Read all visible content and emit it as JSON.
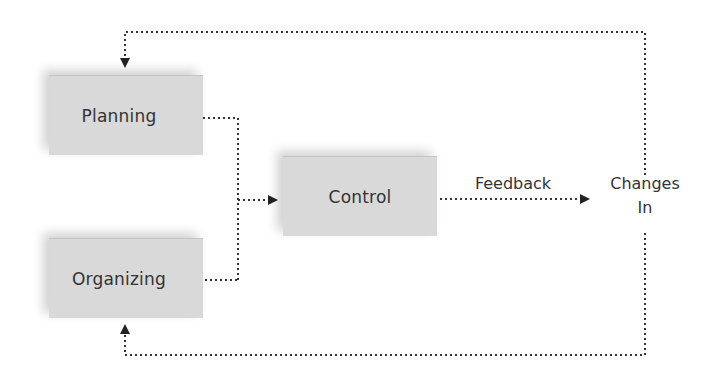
{
  "diagram": {
    "nodes": [
      {
        "id": "planning",
        "label": "Planning"
      },
      {
        "id": "organizing",
        "label": "Organizing"
      },
      {
        "id": "control",
        "label": "Control"
      }
    ],
    "feedback_label": "Feedback",
    "changes_label_line1": "Changes",
    "changes_label_line2": "In",
    "edges": [
      {
        "from": "planning",
        "to": "control",
        "style": "dotted"
      },
      {
        "from": "organizing",
        "to": "control",
        "style": "dotted"
      },
      {
        "from": "control",
        "to": "changes_in",
        "label": "Feedback",
        "style": "dotted"
      },
      {
        "from": "changes_in",
        "to": "planning",
        "style": "dotted"
      },
      {
        "from": "changes_in",
        "to": "organizing",
        "style": "dotted"
      }
    ],
    "colors": {
      "box_fill": "#d9d9d9",
      "line": "#333333",
      "text": "#333333"
    }
  }
}
